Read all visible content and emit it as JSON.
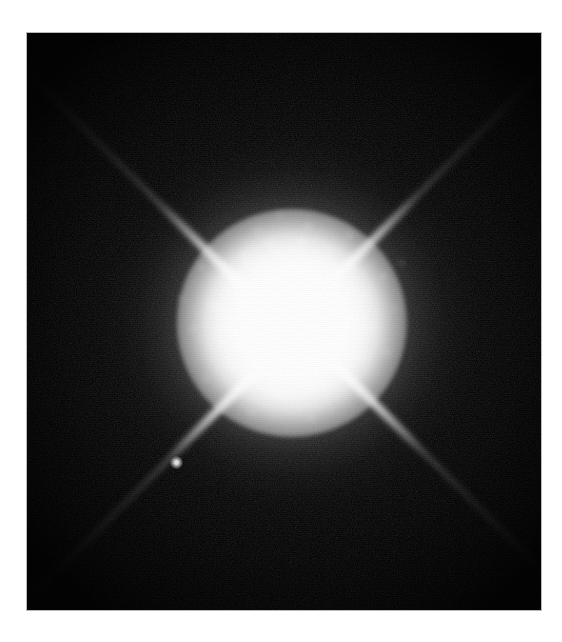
{
  "page": {
    "background_color": "#ffffff",
    "caption": ""
  },
  "photo": {
    "name": "Sirius A and Sirius B",
    "kind": "astronomical-image",
    "frame": {
      "x": 27,
      "y": 33,
      "width": 514,
      "height": 577,
      "background_color": "#030303",
      "border_color": "#b9b9b9"
    },
    "primary_star": {
      "label": "Sirius A",
      "center_x_pct": 51.5,
      "center_y_pct": 50.2,
      "saturated_core_diameter_px": 120,
      "core_color": "#ffffff"
    },
    "companion_star": {
      "label": "Sirius B",
      "x": 143,
      "y": 423,
      "diameter_px": 13,
      "color": "#f4f4f4"
    },
    "halo": {
      "description": "mottled speckled grey scattering halo",
      "radius_px": 175,
      "color": "#9b9b9b"
    },
    "diffraction_spikes": {
      "count": 4,
      "angles_deg": [
        45,
        135,
        225,
        315
      ],
      "length_px": 420,
      "color": "#ffffff"
    },
    "speckle_blobs": [
      {
        "x": 40,
        "y": 44,
        "r": 8,
        "a": 0.4
      },
      {
        "x": 61,
        "y": 31,
        "r": 6,
        "a": 0.34
      },
      {
        "x": 18,
        "y": 63,
        "r": 7,
        "a": 0.3
      },
      {
        "x": -14,
        "y": 72,
        "r": 9,
        "a": 0.36
      },
      {
        "x": -42,
        "y": 60,
        "r": 7,
        "a": 0.3
      },
      {
        "x": -62,
        "y": 40,
        "r": 8,
        "a": 0.34
      },
      {
        "x": -74,
        "y": 14,
        "r": 7,
        "a": 0.3
      },
      {
        "x": -78,
        "y": -16,
        "r": 8,
        "a": 0.33
      },
      {
        "x": -66,
        "y": -44,
        "r": 7,
        "a": 0.3
      },
      {
        "x": -46,
        "y": -66,
        "r": 8,
        "a": 0.35
      },
      {
        "x": -20,
        "y": -78,
        "r": 7,
        "a": 0.32
      },
      {
        "x": 10,
        "y": -80,
        "r": 8,
        "a": 0.38
      },
      {
        "x": 38,
        "y": -70,
        "r": 7,
        "a": 0.34
      },
      {
        "x": 60,
        "y": -52,
        "r": 8,
        "a": 0.33
      },
      {
        "x": 74,
        "y": -28,
        "r": 7,
        "a": 0.3
      },
      {
        "x": 80,
        "y": 4,
        "r": 8,
        "a": 0.33
      },
      {
        "x": 72,
        "y": 34,
        "r": 7,
        "a": 0.3
      },
      {
        "x": 92,
        "y": -46,
        "r": 6,
        "a": 0.26
      },
      {
        "x": 58,
        "y": -88,
        "r": 6,
        "a": 0.28
      },
      {
        "x": 16,
        "y": -96,
        "r": 6,
        "a": 0.26
      },
      {
        "x": -34,
        "y": -92,
        "r": 6,
        "a": 0.24
      },
      {
        "x": -90,
        "y": -56,
        "r": 6,
        "a": 0.22
      },
      {
        "x": -98,
        "y": 6,
        "r": 6,
        "a": 0.22
      },
      {
        "x": -86,
        "y": 56,
        "r": 6,
        "a": 0.22
      },
      {
        "x": -40,
        "y": 90,
        "r": 6,
        "a": 0.24
      },
      {
        "x": 20,
        "y": 96,
        "r": 6,
        "a": 0.24
      },
      {
        "x": 68,
        "y": 70,
        "r": 6,
        "a": 0.22
      },
      {
        "x": 96,
        "y": 30,
        "r": 6,
        "a": 0.22
      },
      {
        "x": 104,
        "y": -14,
        "r": 5,
        "a": 0.18
      },
      {
        "x": -12,
        "y": -108,
        "r": 5,
        "a": 0.18
      },
      {
        "x": 110,
        "y": -60,
        "r": 5,
        "a": 0.16
      },
      {
        "x": -110,
        "y": -24,
        "r": 5,
        "a": 0.16
      }
    ]
  }
}
